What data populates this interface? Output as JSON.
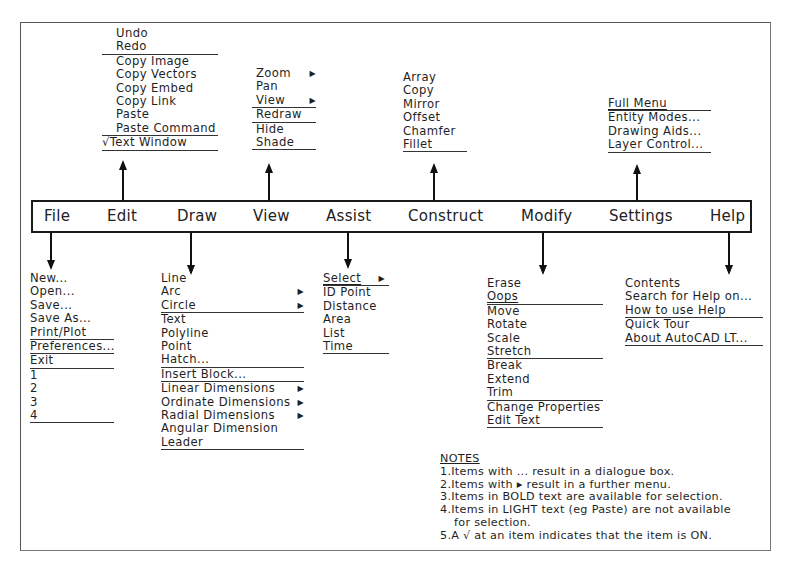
{
  "menubar": {
    "items": [
      "File",
      "Edit",
      "Draw",
      "View",
      "Assist",
      "Construct",
      "Modify",
      "Settings",
      "Help"
    ]
  },
  "menus": {
    "edit": {
      "items": [
        {
          "label": "Undo"
        },
        {
          "label": "Redo",
          "separator_after": true
        },
        {
          "label": "Copy Image"
        },
        {
          "label": "Copy Vectors"
        },
        {
          "label": "Copy Embed"
        },
        {
          "label": "Copy Link"
        },
        {
          "label": "Paste"
        },
        {
          "label": "Paste Command",
          "separator_after": true
        },
        {
          "label": "√Text Window",
          "checked": true,
          "separator_after": true
        }
      ]
    },
    "view": {
      "items": [
        {
          "label": "Zoom",
          "submenu": true
        },
        {
          "label": "Pan"
        },
        {
          "label": "View",
          "submenu": true,
          "separator_after": true
        },
        {
          "label": "Redraw",
          "separator_after": true
        },
        {
          "label": "Hide"
        },
        {
          "label": "Shade",
          "separator_after": true
        }
      ]
    },
    "construct": {
      "items": [
        {
          "label": "Array"
        },
        {
          "label": "Copy"
        },
        {
          "label": "Mirror"
        },
        {
          "label": "Offset"
        },
        {
          "label": "Chamfer"
        },
        {
          "label": "Fillet",
          "separator_after": true
        }
      ]
    },
    "settings": {
      "items": [
        {
          "label": "Full Menu",
          "separator_after": true
        },
        {
          "label": "Entity Modes..."
        },
        {
          "label": "Drawing Aids..."
        },
        {
          "label": "Layer Control...",
          "separator_after": true
        }
      ]
    },
    "file": {
      "items": [
        {
          "label": "New..."
        },
        {
          "label": "Open..."
        },
        {
          "label": "Save..."
        },
        {
          "label": "Save As..."
        },
        {
          "label": "Print/Plot",
          "separator_after": true
        },
        {
          "label": "Preferences...",
          "separator_after": true
        },
        {
          "label": "Exit",
          "separator_after": true
        },
        {
          "label": "1"
        },
        {
          "label": "2"
        },
        {
          "label": "3"
        },
        {
          "label": "4",
          "separator_after": true
        }
      ]
    },
    "draw": {
      "items": [
        {
          "label": "Line"
        },
        {
          "label": "Arc",
          "submenu": true
        },
        {
          "label": "Circle",
          "submenu": true,
          "separator_after": true
        },
        {
          "label": "Text"
        },
        {
          "label": "Polyline"
        },
        {
          "label": "Point"
        },
        {
          "label": "Hatch...",
          "separator_after": true
        },
        {
          "label": "Insert Block...",
          "separator_after": true
        },
        {
          "label": "Linear Dimensions",
          "submenu": true
        },
        {
          "label": "Ordinate Dimensions",
          "submenu": true
        },
        {
          "label": "Radial Dimensions",
          "submenu": true
        },
        {
          "label": "Angular Dimension"
        },
        {
          "label": "Leader",
          "separator_after": true
        }
      ]
    },
    "assist": {
      "items": [
        {
          "label": "Select",
          "submenu": true,
          "separator_after": true
        },
        {
          "label": "ID Point"
        },
        {
          "label": "Distance"
        },
        {
          "label": "Area"
        },
        {
          "label": "List"
        },
        {
          "label": "Time",
          "separator_after": true
        }
      ]
    },
    "modify": {
      "items": [
        {
          "label": "Erase"
        },
        {
          "label": "Oops",
          "separator_after": true
        },
        {
          "label": "Move"
        },
        {
          "label": "Rotate"
        },
        {
          "label": "Scale"
        },
        {
          "label": "Stretch",
          "separator_after": true
        },
        {
          "label": "Break"
        },
        {
          "label": "Extend"
        },
        {
          "label": "Trim",
          "separator_after": true
        },
        {
          "label": "Change Properties"
        },
        {
          "label": "Edit Text",
          "separator_after": true
        }
      ]
    },
    "help": {
      "items": [
        {
          "label": "Contents"
        },
        {
          "label": "Search for Help on..."
        },
        {
          "label": "How to use Help",
          "separator_after": true
        },
        {
          "label": "Quick Tour"
        },
        {
          "label": "About AutoCAD LT...",
          "separator_after": true
        }
      ]
    }
  },
  "notes": {
    "title": "NOTES",
    "lines": [
      "1.Items with ... result in a dialogue box.",
      "2.Items with ▸ result in a further menu.",
      "3.Items in BOLD text are available for selection.",
      "4.Items in LIGHT text (eg Paste) are not available",
      "for selection.",
      "5.A √ at an item indicates that the item is ON."
    ]
  },
  "icons": {
    "submenu_arrow": "▶"
  }
}
